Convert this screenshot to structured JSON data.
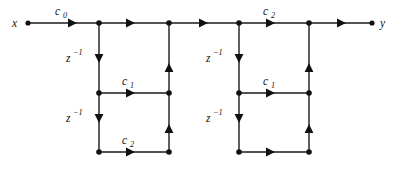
{
  "figure": {
    "kind": "signal-flow-graph",
    "background_color": "#ffffff",
    "line_color": "#1a1a1a",
    "node_color": "#111111",
    "width": 399,
    "height": 172
  },
  "terminals": {
    "input": {
      "label": "x",
      "x": 28,
      "y": 23
    },
    "output": {
      "label": "y",
      "x": 372,
      "y": 23
    }
  },
  "gains": {
    "c0": {
      "label_base": "c",
      "label_sub": "0",
      "full": "c0",
      "x": 61,
      "y": 12
    },
    "section1_c1": {
      "label_base": "c",
      "label_sub": "1",
      "full": "c1",
      "x": 127,
      "y": 82
    },
    "section1_c2": {
      "label_base": "c",
      "label_sub": "2",
      "full": "c2",
      "x": 127,
      "y": 141
    },
    "section2_c2_top": {
      "label_base": "c",
      "label_sub": "2",
      "full": "c2",
      "x": 268,
      "y": 12
    },
    "section2_c1": {
      "label_base": "c",
      "label_sub": "1",
      "full": "c1",
      "x": 268,
      "y": 82
    }
  },
  "delays": [
    {
      "name": "section1-delay-upper",
      "label_base": "z",
      "label_sup": "−1",
      "full": "z^-1",
      "x": 62,
      "y": 58
    },
    {
      "name": "section1-delay-lower",
      "label_base": "z",
      "label_sup": "−1",
      "full": "z^-1",
      "x": 62,
      "y": 118
    },
    {
      "name": "section2-delay-upper",
      "label_base": "z",
      "label_sup": "−1",
      "full": "z^-1",
      "x": 203,
      "y": 58
    },
    {
      "name": "section2-delay-lower",
      "label_base": "z",
      "label_sup": "−1",
      "full": "z^-1",
      "x": 203,
      "y": 118
    }
  ],
  "rows": {
    "top_y": 23,
    "middle_y": 93,
    "bottom_y": 152
  },
  "columns": {
    "input_x": 28,
    "s1_left_x": 99,
    "s1_right_x": 169,
    "s2_left_x": 239,
    "s2_right_x": 309,
    "output_x": 372
  },
  "nodes": [
    {
      "name": "node-input",
      "x": 28,
      "y": 23
    },
    {
      "name": "node-s1-top-left",
      "x": 99,
      "y": 23
    },
    {
      "name": "node-s1-top-right",
      "x": 169,
      "y": 23
    },
    {
      "name": "node-s2-top-left",
      "x": 239,
      "y": 23
    },
    {
      "name": "node-s2-top-right",
      "x": 309,
      "y": 23
    },
    {
      "name": "node-output",
      "x": 372,
      "y": 23
    },
    {
      "name": "node-s1-mid-left",
      "x": 99,
      "y": 93
    },
    {
      "name": "node-s1-mid-right",
      "x": 169,
      "y": 93
    },
    {
      "name": "node-s2-mid-left",
      "x": 239,
      "y": 93
    },
    {
      "name": "node-s2-mid-right",
      "x": 309,
      "y": 93
    },
    {
      "name": "node-s1-bot-left",
      "x": 99,
      "y": 152
    },
    {
      "name": "node-s1-bot-right",
      "x": 169,
      "y": 152
    },
    {
      "name": "node-s2-bot-left",
      "x": 239,
      "y": 152
    },
    {
      "name": "node-s2-bot-right",
      "x": 309,
      "y": 152
    }
  ]
}
